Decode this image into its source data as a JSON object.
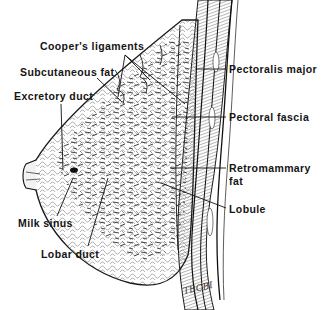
{
  "diagram": {
    "ink_color": "#141414",
    "background": "#ffffff",
    "labels": {
      "coopers_ligaments": "Cooper's ligaments",
      "subcutaneous_fat": "Subcutaneous fat",
      "excretory_duct": "Excretory duct",
      "pectoralis_major": "Pectoralis major",
      "pectoral_fascia": "Pectoral fascia",
      "retromammary_fat_line1": "Retromammary",
      "retromammary_fat_line2": "fat",
      "lobule": "Lobule",
      "milk_sinus": "Milk sinus",
      "lobar_duct": "Lobar duct"
    },
    "artist_signature": "TBCBI"
  }
}
